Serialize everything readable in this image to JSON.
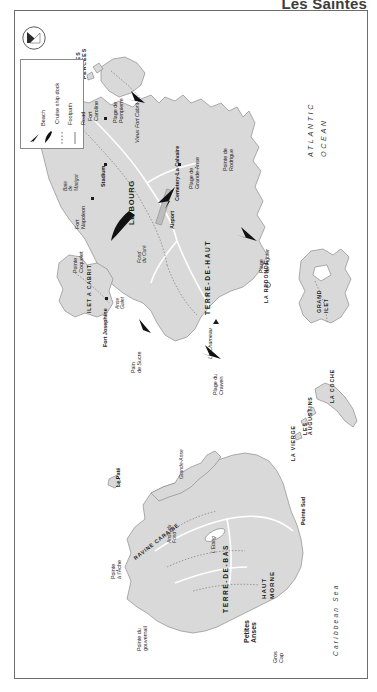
{
  "title": "Les Saintes",
  "orientation": "map is rotated 90 degrees; all labels read bottom-to-top",
  "legend": {
    "title": "",
    "items": [
      {
        "label": "Beach",
        "symbol": "beach-arrow"
      },
      {
        "label": "Cruise ship dock",
        "symbol": "dock-arrow"
      },
      {
        "label": "Footpath",
        "symbol": "dotted-line"
      },
      {
        "label": "Road",
        "symbol": "solid-line"
      }
    ]
  },
  "compass": {
    "label": "N",
    "name": "north-arrow"
  },
  "water_bodies": [
    {
      "name": "ATLANTIC OCEAN",
      "type": "ocean"
    },
    {
      "name": "Caribbean Sea",
      "type": "sea"
    },
    {
      "name": "Baie de Marigot",
      "type": "bay"
    },
    {
      "name": "Fond du Curé",
      "type": "bay"
    },
    {
      "name": "Anse Galet",
      "type": "bay"
    },
    {
      "name": "Grande-Anse",
      "type": "bay"
    },
    {
      "name": "L'Etang",
      "type": "pond"
    },
    {
      "name": "Anse du Fond",
      "type": "bay"
    }
  ],
  "islands": [
    {
      "name": "TERRE-DE-HAUT",
      "type": "main-island"
    },
    {
      "name": "TERRE-DE-BAS",
      "type": "main-island"
    },
    {
      "name": "ILET A CABRIT",
      "type": "islet"
    },
    {
      "name": "GRAND ILET",
      "type": "islet"
    },
    {
      "name": "LA COCHE",
      "type": "islet"
    },
    {
      "name": "LA REDONDE",
      "type": "islet"
    },
    {
      "name": "LES AUGUSTINS",
      "type": "rocks"
    },
    {
      "name": "LA VIERGE",
      "type": "rock"
    },
    {
      "name": "LES ROCHES PERCEES",
      "type": "rocks"
    },
    {
      "name": "Le Paté",
      "type": "islet"
    }
  ],
  "settlements": [
    {
      "name": "LE BOURG",
      "island": "TERRE-DE-HAUT"
    },
    {
      "name": "Petites Anses",
      "island": "TERRE-DE-BAS"
    }
  ],
  "sites": [
    {
      "name": "Fort Napoleon",
      "type": "fort"
    },
    {
      "name": "Fort Caroline",
      "type": "fort"
    },
    {
      "name": "Fort Josephine",
      "type": "fort"
    },
    {
      "name": "Vieux Fort Cabrit",
      "type": "fort"
    },
    {
      "name": "Stadium",
      "type": "stadium"
    },
    {
      "name": "Cemetery-La Calvaire",
      "type": "cemetery"
    },
    {
      "name": "Airport",
      "type": "airport"
    },
    {
      "name": "Le Chameau",
      "type": "summit"
    },
    {
      "name": "HAUT MORNE",
      "type": "summit"
    },
    {
      "name": "Pain de Sucre",
      "type": "headland"
    }
  ],
  "beaches": [
    {
      "name": "Plage de Pompierre"
    },
    {
      "name": "Plage de Grande-Anse"
    },
    {
      "name": "Plage du Figuier"
    },
    {
      "name": "Plage du Crawen"
    }
  ],
  "points": [
    {
      "name": "Pointe Morel"
    },
    {
      "name": "Pointe Zozio"
    },
    {
      "name": "Pointe de Rodrigue"
    },
    {
      "name": "Pointe Coquelet"
    },
    {
      "name": "Pointe Sud"
    },
    {
      "name": "Pointe à l'Âche"
    },
    {
      "name": "Pointe du gouvernail"
    },
    {
      "name": "Gros Cap"
    }
  ],
  "other_features": [
    {
      "name": "Vieux Fort Cabrit"
    },
    {
      "name": "RAVINE CARAIBE"
    }
  ],
  "map_labels": {
    "pointe_morel": "Pointe Morel",
    "pointe_zozio": "Pointe Zozio",
    "les_roches_percees": "LES ROCHES PERCEES",
    "fort_caroline": "Fort Caroline",
    "plage_de_pompierre": "Plage de Pompierre",
    "vieux_fort_cabrit": "Vieux Fort Cabrit",
    "stadium": "Stadium",
    "cemetery": "Cemetery-La Calvaire",
    "plage_grande_anse": "Plage de Grande-Anse",
    "pointe_rodrigue": "Pointe de Rodrigue",
    "atlantic_ocean": "ATLANTIC OCEAN",
    "baie_de_marigot": "Baie de Marigot",
    "fort_napoleon": "Fort Napoleon",
    "le_bourg": "LE BOURG",
    "airport": "Airport",
    "terre_de_haut": "TERRE-DE-HAUT",
    "fond_du_cure": "Fond du Curé",
    "anse_galet": "Anse Galet",
    "plage_du_figuier": "Plage du Figuier",
    "le_chameau": "Le Chameau",
    "pain_de_sucre": "Pain de Sucre",
    "plage_du_crawen": "Plage du Crawen",
    "pointe_coquelet": "Pointe Coquelet",
    "ilet_a_cabrit": "ILET A CABRIT",
    "fort_josephine": "Fort Josephine",
    "la_redonde": "LA REDONDE",
    "grand_ilet": "GRAND ILET",
    "la_coche": "LA COCHE",
    "les_augustins": "LES AUGUSTINS",
    "la_vierge": "LA VIERGE",
    "le_pate": "Le Paté",
    "grande_anse": "Grande-Anse",
    "pointe_a_lache": "Pointe à l'Âche",
    "ravine_caraibe": "RAVINE CARAIBE",
    "anse_du_fond": "Anse du Fond",
    "letang": "L'Etang",
    "terre_de_bas": "TERRE-DE-BAS",
    "haut_morne": "HAUT MORNE",
    "pointe_sud": "Pointe Sud",
    "petites_anses": "Petites Anses",
    "gros_cap": "Gros Cap",
    "pointe_du_gouvernail": "Pointe du gouvernail",
    "caribbean_sea": "Caribbean Sea"
  },
  "colors": {
    "land": "#d9d9d9",
    "land_outline": "#8d8d8d",
    "water": "#ffffff",
    "text": "#1c1c1c",
    "frame": "#6d6d6d",
    "title": "#3d3d3d"
  }
}
